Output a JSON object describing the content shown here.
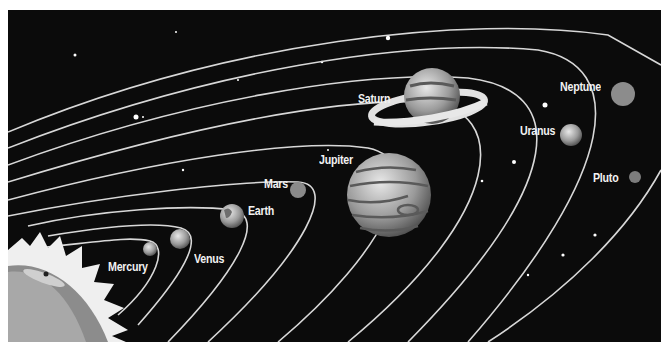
{
  "diagram": {
    "colors": {
      "background": "#0b0b0b",
      "orbit": "#d8d8d8",
      "label": "#f2f2f2",
      "page": "#ffffff"
    },
    "sun": {
      "label": "Sun (unlabeled)"
    },
    "planets": [
      {
        "name": "Mercury",
        "label": "Mercury"
      },
      {
        "name": "Venus",
        "label": "Venus"
      },
      {
        "name": "Earth",
        "label": "Earth"
      },
      {
        "name": "Mars",
        "label": "Mars"
      },
      {
        "name": "Jupiter",
        "label": "Jupiter"
      },
      {
        "name": "Saturn",
        "label": "Saturn"
      },
      {
        "name": "Uranus",
        "label": "Uranus"
      },
      {
        "name": "Neptune",
        "label": "Neptune"
      },
      {
        "name": "Pluto",
        "label": "Pluto"
      }
    ]
  }
}
